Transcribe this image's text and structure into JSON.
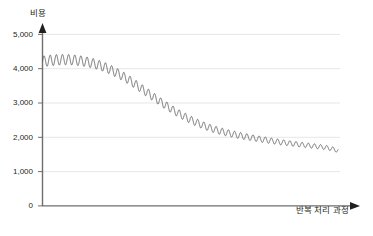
{
  "chart_data": {
    "type": "line",
    "title": "",
    "xlabel": "반복 처리 과정",
    "ylabel": "비용",
    "ylim": [
      0,
      5000
    ],
    "xlim": [
      0,
      100
    ],
    "grid": true,
    "gridlines_y": [
      1000,
      2000,
      3000,
      4000,
      5000
    ],
    "legend": null,
    "legend_position": "none",
    "ytick_labels": [
      "5,000",
      "4,000",
      "3,000",
      "2,000",
      "1,000",
      "0"
    ],
    "ytick_values": [
      5000,
      4000,
      3000,
      2000,
      1000,
      0
    ],
    "xtick_labels": [],
    "line_color": "#58585b",
    "series": [
      {
        "name": "비용",
        "description": "damped oscillating cost curve decreasing over iterations",
        "trend_start": 4200,
        "trend_end": 1610,
        "oscillation_period_x": 2.08,
        "amplitude_start": 160,
        "amplitude_end": 60,
        "x": [
          0,
          2,
          4,
          6,
          8,
          10,
          12,
          14,
          16,
          18,
          20,
          22,
          24,
          26,
          28,
          30,
          32,
          34,
          36,
          38,
          40,
          42,
          44,
          46,
          48,
          50,
          52,
          54,
          56,
          58,
          60,
          62,
          64,
          66,
          68,
          70,
          72,
          74,
          76,
          78,
          80,
          82,
          84,
          86,
          88,
          90,
          92,
          94,
          96,
          98,
          100
        ],
        "values": [
          4210,
          4235,
          4250,
          4262,
          4265,
          4258,
          4240,
          4215,
          4180,
          4135,
          4080,
          4010,
          3930,
          3840,
          3740,
          3630,
          3510,
          3390,
          3270,
          3150,
          3030,
          2915,
          2805,
          2700,
          2605,
          2515,
          2435,
          2360,
          2295,
          2235,
          2185,
          2140,
          2100,
          2065,
          2030,
          2000,
          1970,
          1942,
          1915,
          1890,
          1865,
          1842,
          1820,
          1800,
          1780,
          1760,
          1742,
          1722,
          1700,
          1665,
          1610
        ]
      }
    ]
  },
  "axis": {
    "y_arrow": "up-arrow",
    "x_arrow": "right-arrow"
  },
  "caption": {
    "text": ""
  }
}
